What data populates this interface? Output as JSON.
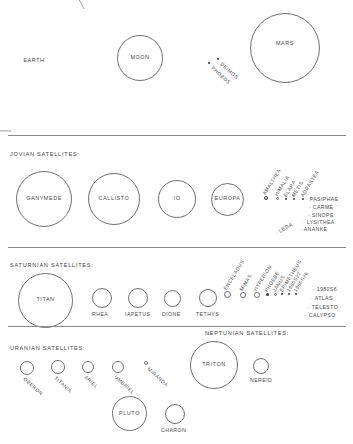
{
  "figure": {
    "background_color": "#ffffff",
    "stroke_color": "#6e6e78",
    "text_color": "#4a4a52"
  },
  "sections": {
    "top_row": {
      "bodies": [
        {
          "label": "EARTH",
          "kind": "arc"
        },
        {
          "label": "MOON",
          "kind": "circle"
        },
        {
          "label": "MARS",
          "kind": "circle"
        }
      ],
      "mars_moons": [
        {
          "label": "DEIMOS",
          "kind": "dot"
        },
        {
          "label": "PHOBOS",
          "kind": "dot"
        }
      ]
    },
    "jovian": {
      "heading": "JOVIAN SATELLITES:",
      "major": [
        {
          "label": "GANYMEDE",
          "kind": "circle"
        },
        {
          "label": "CALLISTO",
          "kind": "circle"
        },
        {
          "label": "IO",
          "kind": "circle"
        },
        {
          "label": "EUROPA",
          "kind": "circle"
        }
      ],
      "diagonal": [
        {
          "label": "AMALTHEA",
          "kind": "ring"
        },
        {
          "label": "HIMALIA",
          "kind": "ring"
        },
        {
          "label": "ELARA",
          "kind": "dot"
        },
        {
          "label": "METIS",
          "kind": "dot"
        },
        {
          "label": "ADRASTEA",
          "kind": "dot"
        }
      ],
      "listed": [
        {
          "label": "PASIPHAE"
        },
        {
          "label": "CARME"
        },
        {
          "label": "SINOPE"
        },
        {
          "label": "LYSITHEA"
        },
        {
          "label": "ANANKE"
        },
        {
          "label": "LEDA"
        }
      ]
    },
    "saturnian": {
      "heading": "SATURNIAN SATELLITES:",
      "major": [
        {
          "label": "TITAN",
          "kind": "circle"
        },
        {
          "label": "RHEA",
          "kind": "circle"
        },
        {
          "label": "IAPETUS",
          "kind": "circle"
        },
        {
          "label": "DIONE",
          "kind": "circle"
        },
        {
          "label": "TETHYS",
          "kind": "circle"
        }
      ],
      "diagonal": [
        {
          "label": "ENCELADUS",
          "kind": "ring"
        },
        {
          "label": "MIMAS",
          "kind": "ring"
        },
        {
          "label": "HYPERION",
          "kind": "ring"
        },
        {
          "label": "PHOEBE",
          "kind": "dot"
        },
        {
          "label": "JANUS",
          "kind": "ring"
        },
        {
          "label": "EPIMETHEUS",
          "kind": "dot"
        },
        {
          "label": "1980S27",
          "kind": "dot"
        },
        {
          "label": "1980S26",
          "kind": "dot"
        }
      ],
      "listed": [
        {
          "label": "1980S6"
        },
        {
          "label": "ATLAS"
        },
        {
          "label": "TELESTO"
        },
        {
          "label": "CALYPSO"
        }
      ]
    },
    "uranian": {
      "heading": "URANIAN SATELLITES:",
      "moons": [
        {
          "label": "OBERON",
          "kind": "circle"
        },
        {
          "label": "TITANIA",
          "kind": "circle"
        },
        {
          "label": "ARIEL",
          "kind": "circle"
        },
        {
          "label": "UMBRIEL",
          "kind": "circle"
        },
        {
          "label": "MIRANDA",
          "kind": "ring"
        }
      ]
    },
    "neptunian": {
      "heading": "NEPTUNIAN SATELLITES:",
      "moons": [
        {
          "label": "TRITON",
          "kind": "circle"
        },
        {
          "label": "NEREID",
          "kind": "circle"
        }
      ]
    },
    "plutonian": {
      "moons": [
        {
          "label": "PLUTO",
          "kind": "circle"
        },
        {
          "label": "CHARON",
          "kind": "circle"
        }
      ]
    }
  }
}
